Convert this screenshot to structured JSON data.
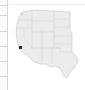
{
  "sidebar": {
    "rows": [
      {
        "y": 5
      },
      {
        "y": 15
      },
      {
        "y": 31
      },
      {
        "y": 46
      },
      {
        "y": 61
      },
      {
        "y": 76
      }
    ]
  },
  "map": {
    "region": "Western United States",
    "fill_color": "#ececec",
    "border_color": "#bdbdbd",
    "markers": [
      {
        "name": "southern-california-marker",
        "x": 20.5,
        "y": 47.5,
        "color": "#2b2b2b"
      },
      {
        "name": "washington-marker",
        "x": 22,
        "y": 14,
        "color": "#9a9a9a"
      }
    ]
  }
}
